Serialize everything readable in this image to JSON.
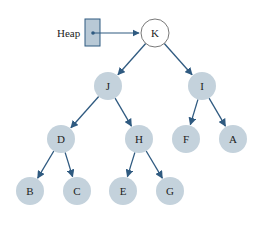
{
  "diagram": {
    "type": "binary-tree-heap",
    "pointer_label": "Heap",
    "colors": {
      "node_fill": "#c4d2dc",
      "root_fill": "#ffffff",
      "root_stroke": "#555555",
      "edge": "#2f5a80",
      "pointer_box": "#b8c9d6"
    },
    "nodes": [
      {
        "id": "K",
        "label": "K",
        "x": 155,
        "y": 33,
        "root": true
      },
      {
        "id": "J",
        "label": "J",
        "x": 108,
        "y": 86
      },
      {
        "id": "I",
        "label": "I",
        "x": 202,
        "y": 86
      },
      {
        "id": "D",
        "label": "D",
        "x": 61,
        "y": 139
      },
      {
        "id": "H",
        "label": "H",
        "x": 139,
        "y": 139
      },
      {
        "id": "F",
        "label": "F",
        "x": 186,
        "y": 139
      },
      {
        "id": "A",
        "label": "A",
        "x": 233,
        "y": 139
      },
      {
        "id": "B",
        "label": "B",
        "x": 30,
        "y": 191
      },
      {
        "id": "C",
        "label": "C",
        "x": 77,
        "y": 191
      },
      {
        "id": "E",
        "label": "E",
        "x": 123,
        "y": 191
      },
      {
        "id": "G",
        "label": "G",
        "x": 170,
        "y": 191
      }
    ],
    "edges": [
      [
        "K",
        "J"
      ],
      [
        "K",
        "I"
      ],
      [
        "J",
        "D"
      ],
      [
        "J",
        "H"
      ],
      [
        "I",
        "F"
      ],
      [
        "I",
        "A"
      ],
      [
        "D",
        "B"
      ],
      [
        "D",
        "C"
      ],
      [
        "H",
        "E"
      ],
      [
        "H",
        "G"
      ]
    ],
    "caption": "(b) Heap"
  }
}
